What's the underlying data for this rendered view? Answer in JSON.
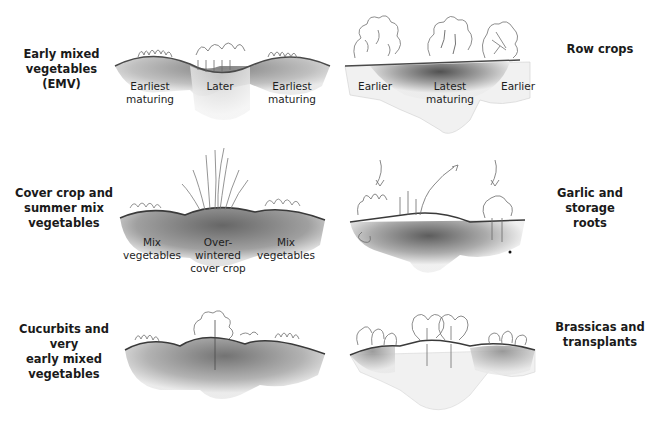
{
  "panels": [
    {
      "id": "emv",
      "title": "Early mixed vegetables (EMV)",
      "title_lines": [
        "Early mixed",
        "vegetables (EMV)"
      ],
      "labels": [
        {
          "lines": [
            "Earliest",
            "maturing"
          ]
        },
        {
          "lines": [
            "Later"
          ]
        },
        {
          "lines": [
            "Earliest",
            "maturing"
          ]
        }
      ]
    },
    {
      "id": "row-crops",
      "title": "Row crops",
      "title_lines": [
        "Row crops"
      ],
      "labels": [
        {
          "lines": [
            "Earlier"
          ]
        },
        {
          "lines": [
            "Latest",
            "maturing"
          ]
        },
        {
          "lines": [
            "Earlier"
          ]
        }
      ]
    },
    {
      "id": "cover-crop",
      "title": "Cover crop and summer mix vegetables",
      "title_lines": [
        "Cover crop and",
        "summer mix",
        "vegetables"
      ],
      "labels": [
        {
          "lines": [
            "Mix",
            "vegetables"
          ]
        },
        {
          "lines": [
            "Over-",
            "wintered",
            "cover crop"
          ]
        },
        {
          "lines": [
            "Mix",
            "vegetables"
          ]
        }
      ]
    },
    {
      "id": "garlic",
      "title": "Garlic and storage roots",
      "title_lines": [
        "Garlic and storage",
        "roots"
      ],
      "labels": []
    },
    {
      "id": "cucurbits",
      "title": "Cucurbits and very early mixed vegetables",
      "title_lines": [
        "Cucurbits and very",
        "early mixed",
        "vegetables"
      ],
      "labels": []
    },
    {
      "id": "brassicas",
      "title": "Brassicas and transplants",
      "title_lines": [
        "Brassicas and",
        "transplants"
      ],
      "labels": []
    }
  ],
  "colors": {
    "soil_dark": "#4a4a4a",
    "soil_mid": "#8a8a8a",
    "soil_light": "#c8c8c8",
    "plant_line": "#5a5a5a",
    "text": "#1a1a1a"
  }
}
